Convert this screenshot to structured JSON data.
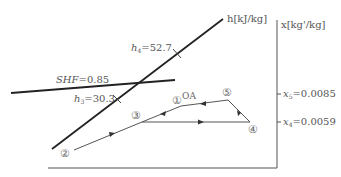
{
  "diagram": {
    "type": "psychrometric-process-diagram",
    "axes": {
      "enthalpy_axis_label": "h[kJ/kg]",
      "humidity_axis_label": "x[kg'/kg]"
    },
    "enthalpy_marks": [
      {
        "symbol": "h",
        "sub": "4",
        "value": "=52.7"
      },
      {
        "symbol": "h",
        "sub": "3",
        "value": "=30.3"
      }
    ],
    "shf": {
      "symbol": "SHF",
      "value": "=0.85"
    },
    "humidity_marks": [
      {
        "symbol": "x",
        "sub": "5",
        "value": "=0.0085"
      },
      {
        "symbol": "x",
        "sub": "4",
        "value": "=0.0059"
      }
    ],
    "points": [
      {
        "id": "1",
        "glyph": "①",
        "note": "OA"
      },
      {
        "id": "2",
        "glyph": "②"
      },
      {
        "id": "3",
        "glyph": "③"
      },
      {
        "id": "4",
        "glyph": "④"
      },
      {
        "id": "5",
        "glyph": "⑤"
      }
    ],
    "colors": {
      "line": "#222222",
      "process": "#555555",
      "text": "#555555"
    }
  }
}
